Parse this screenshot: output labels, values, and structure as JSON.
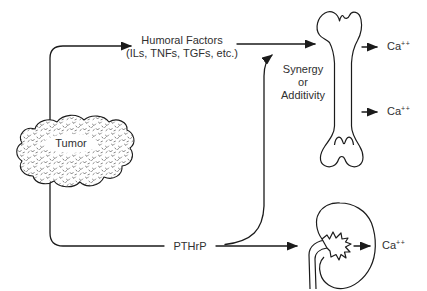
{
  "colors": {
    "background": "#ffffff",
    "line": "#1b1b1b",
    "text": "#303030"
  },
  "labels": {
    "humoral_factors_line1": "Humoral Factors",
    "humoral_factors_line2": "(ILs, TNFs, TGFs, etc.)",
    "synergy_line1": "Synergy",
    "synergy_line2": "or",
    "synergy_line3": "Additivity",
    "tumor": "Tumor",
    "pthrp": "PTHrP"
  },
  "ca_outputs": [
    {
      "location": "bone-upper",
      "base": "Ca",
      "superscript": "++"
    },
    {
      "location": "bone-lower",
      "base": "Ca",
      "superscript": "++"
    },
    {
      "location": "kidney",
      "base": "Ca",
      "superscript": "++"
    }
  ],
  "icons": {
    "tumor": "stippled-tumor-mass",
    "bone": "femur-bone",
    "kidney": "kidney"
  },
  "edges": [
    {
      "from": "Tumor",
      "to": "Humoral Factors",
      "arrowhead": true
    },
    {
      "from": "Humoral Factors",
      "to": "Bone",
      "arrowhead": true
    },
    {
      "from": "Tumor",
      "to": "PTHrP",
      "arrowhead": false
    },
    {
      "from": "PTHrP",
      "to": "Kidney",
      "arrowhead": true
    },
    {
      "from": "PTHrP",
      "to": "Bone",
      "arrowhead": true,
      "note": "Synergy or Additivity"
    },
    {
      "from": "Bone",
      "to": "Ca++ (upper)",
      "arrowhead": true
    },
    {
      "from": "Bone",
      "to": "Ca++ (lower)",
      "arrowhead": true
    },
    {
      "from": "Kidney",
      "to": "Ca++",
      "arrowhead": true
    }
  ]
}
